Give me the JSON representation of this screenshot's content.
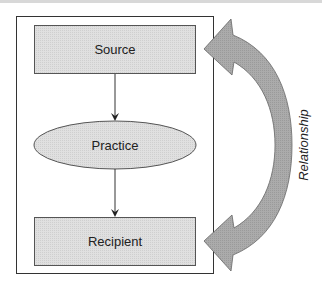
{
  "diagram": {
    "nodes": {
      "source": {
        "label": "Source",
        "shape": "rectangle"
      },
      "practice": {
        "label": "Practice",
        "shape": "ellipse"
      },
      "recipient": {
        "label": "Recipient",
        "shape": "rectangle"
      }
    },
    "edges": [
      {
        "from": "Source",
        "to": "Practice"
      },
      {
        "from": "Practice",
        "to": "Recipient"
      }
    ],
    "relationship_arrow": {
      "label": "Relationship",
      "type": "double-headed curved arrow",
      "connects": [
        "Source",
        "Recipient"
      ]
    },
    "colors": {
      "node_fill": "#dcdcdc",
      "arrow_fill": "#a8a8a8",
      "stroke": "#333333"
    }
  }
}
